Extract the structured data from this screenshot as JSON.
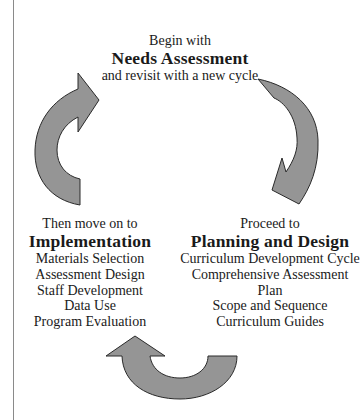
{
  "diagram": {
    "type": "cycle",
    "arrow_color": "#959595",
    "stages": {
      "needs": {
        "lead": "Begin with",
        "title": "Needs Assessment",
        "trail": "and revisit with a new cycle"
      },
      "planning": {
        "lead": "Proceed to",
        "title": "Planning and Design",
        "items": [
          "Curriculum Development Cycle",
          "Comprehensive Assessment Plan",
          "Scope and Sequence",
          "Curriculum Guides"
        ]
      },
      "implementation": {
        "lead": "Then move on to",
        "title": "Implementation",
        "items": [
          "Materials Selection",
          "Assessment Design",
          "Staff Development",
          "Data Use",
          "Program Evaluation"
        ]
      }
    },
    "arrows": [
      {
        "from": "implementation",
        "to": "needs",
        "position": "left"
      },
      {
        "from": "needs",
        "to": "planning",
        "position": "right"
      },
      {
        "from": "planning",
        "to": "implementation",
        "position": "bottom"
      }
    ]
  }
}
